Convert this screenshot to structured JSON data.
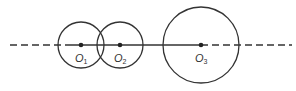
{
  "diagram": {
    "type": "geometry",
    "line": {
      "y": 45,
      "style_left": "dashed",
      "style_middle": "solid",
      "style_right": "dashed"
    },
    "circles": [
      {
        "id": "O1",
        "label": "O",
        "subscript": "1",
        "cx": 81,
        "cy": 45,
        "r": 23
      },
      {
        "id": "O2",
        "label": "O",
        "subscript": "2",
        "cx": 120,
        "cy": 45,
        "r": 23
      },
      {
        "id": "O3",
        "label": "O",
        "subscript": "3",
        "cx": 201,
        "cy": 45,
        "r": 38
      }
    ],
    "colors": {
      "stroke": "#333333",
      "text": "#333333",
      "background": "#ffffff"
    }
  }
}
